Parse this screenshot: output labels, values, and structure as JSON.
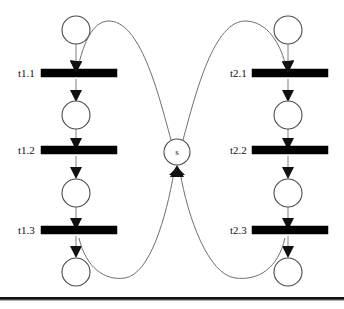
{
  "diagram": {
    "type": "petri-net",
    "canvas": {
      "width": 344,
      "height": 309,
      "background": "#ffffff"
    },
    "colors": {
      "place_stroke": "#4a4a4a",
      "transition_fill": "#000000",
      "arc_stroke": "#8a8a8a",
      "curve_stroke": "#6f6f6f",
      "arrowhead": "#111111",
      "rule": "#111111"
    },
    "shared_place": {
      "label": "s",
      "cx": 177,
      "cy": 152,
      "r": 13
    },
    "branches": [
      {
        "name": "branch-left",
        "column_x": 76,
        "label_x": 18,
        "bar_x": 41,
        "bar_width": 76,
        "places": [
          {
            "name": "place-left-0",
            "cy": 30,
            "r": 14
          },
          {
            "name": "place-left-1",
            "cy": 115,
            "r": 14
          },
          {
            "name": "place-left-2",
            "cy": 193,
            "r": 14
          },
          {
            "name": "place-left-3",
            "cy": 272,
            "r": 14
          }
        ],
        "transitions": [
          {
            "name": "transition-t1-1",
            "label": "t1.1",
            "cy": 73
          },
          {
            "name": "transition-t1-2",
            "label": "t1.2",
            "cy": 150
          },
          {
            "name": "transition-t1-3",
            "label": "t1.3",
            "cy": 230
          }
        ]
      },
      {
        "name": "branch-right",
        "column_x": 288,
        "label_x": 230,
        "bar_x": 252,
        "bar_width": 76,
        "places": [
          {
            "name": "place-right-0",
            "cy": 30,
            "r": 14
          },
          {
            "name": "place-right-1",
            "cy": 115,
            "r": 14
          },
          {
            "name": "place-right-2",
            "cy": 193,
            "r": 14
          },
          {
            "name": "place-right-3",
            "cy": 272,
            "r": 14
          }
        ],
        "transitions": [
          {
            "name": "transition-t2-1",
            "label": "t2.1",
            "cy": 73
          },
          {
            "name": "transition-t2-2",
            "label": "t2.2",
            "cy": 150
          },
          {
            "name": "transition-t2-3",
            "label": "t2.3",
            "cy": 230
          }
        ]
      }
    ],
    "arcs": [
      {
        "name": "arc-s-to-t1-1",
        "from": "s",
        "to": "t1.1",
        "kind": "curved"
      },
      {
        "name": "arc-s-to-t2-1",
        "from": "s",
        "to": "t2.1",
        "kind": "curved"
      },
      {
        "name": "arc-t1-3-to-s",
        "from": "t1.3",
        "to": "s",
        "kind": "curved"
      },
      {
        "name": "arc-t2-3-to-s",
        "from": "t2.3",
        "to": "s",
        "kind": "curved"
      }
    ],
    "bottom_rule": {
      "name": "bottom-rule",
      "y": 297,
      "height": 4
    }
  }
}
